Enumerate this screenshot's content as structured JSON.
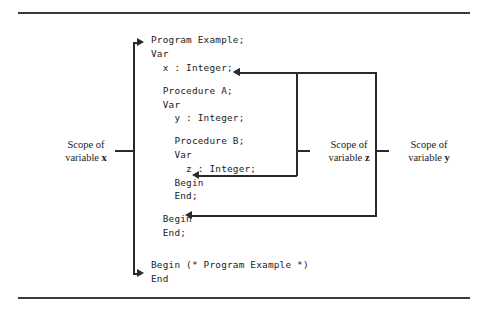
{
  "figure": {
    "code_lines": [
      {
        "text": "Program Example;",
        "indent": 0
      },
      {
        "text": "Var",
        "indent": 0
      },
      {
        "text": "x : Integer;",
        "indent": 1
      },
      {
        "text": "",
        "indent": 0
      },
      {
        "text": "Procedure A;",
        "indent": 1
      },
      {
        "text": "Var",
        "indent": 1
      },
      {
        "text": "y : Integer;",
        "indent": 2
      },
      {
        "text": "",
        "indent": 0
      },
      {
        "text": "Procedure B;",
        "indent": 2
      },
      {
        "text": "Var",
        "indent": 2
      },
      {
        "text": "z : Integer;",
        "indent": 3
      },
      {
        "text": "Begin",
        "indent": 2
      },
      {
        "text": "End;",
        "indent": 2
      },
      {
        "text": "",
        "indent": 0
      },
      {
        "text": "Begin",
        "indent": 1
      },
      {
        "text": "End;",
        "indent": 1
      },
      {
        "text": "",
        "indent": 0
      },
      {
        "text": "",
        "indent": 0
      },
      {
        "text": "Begin (* Program Example *)",
        "indent": 0
      },
      {
        "text": "End",
        "indent": 0
      }
    ],
    "annotations": {
      "scope_x": {
        "line1": "Scope of",
        "line2_prefix": "variable ",
        "line2_var": "x"
      },
      "scope_z": {
        "line1": "Scope of",
        "line2_prefix": "variable ",
        "line2_var": "z"
      },
      "scope_y": {
        "line1": "Scope of",
        "line2_prefix": "variable ",
        "line2_var": "y"
      }
    },
    "colors": {
      "background": "#ffffff",
      "text": "#1b1b1b",
      "rule": "#3a3a3a",
      "connector": "#2a2a2a"
    }
  }
}
